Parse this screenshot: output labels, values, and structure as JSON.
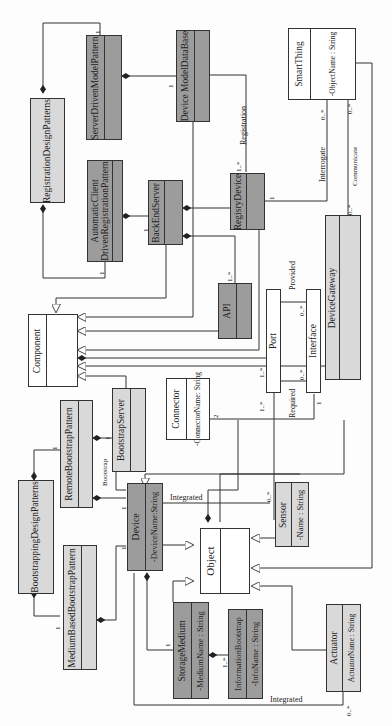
{
  "diagram": {
    "type": "UML class diagram",
    "orientation": "rotated 90 degrees counter-clockwise",
    "classes": {
      "registration_design_patterns": {
        "name": "RegistrationDesignPatterns",
        "attribute": ""
      },
      "server_driven_model_pattern": {
        "name": "ServerDrivenModelPattern",
        "attribute": ""
      },
      "device_model_database": {
        "name": "Device ModelDataBase",
        "attribute": ""
      },
      "smart_thing": {
        "name": "SmartThing",
        "attribute": "-ObjectName : String"
      },
      "automatic_client_driven_registration_pattern": {
        "name_line1": "AutomaticClient",
        "name_line2": "DrivenRegistrationPattern",
        "attribute": ""
      },
      "back_end_server": {
        "name": "BackEndServer",
        "attribute": ""
      },
      "registry_device": {
        "name": "RegisryDevice",
        "attribute": ""
      },
      "device_gateway": {
        "name": "DeviceGateway",
        "attribute": ""
      },
      "api": {
        "name": "API",
        "attribute": ""
      },
      "port": {
        "name": "Port"
      },
      "interface": {
        "name": "Interface"
      },
      "component": {
        "name": "Component",
        "attribute": ""
      },
      "connector": {
        "name": "Connector",
        "attribute": "-ConnectorName: String"
      },
      "remote_bootstrap_pattern": {
        "name": "RemoteBootstrapPattern",
        "attribute": ""
      },
      "bootstrap_server": {
        "name": "BootstrapServer",
        "attribute": ""
      },
      "bootstrapping_design_patterns": {
        "name": "BootstrappingDesignPatterns",
        "attribute": ""
      },
      "device": {
        "name": "Device",
        "attribute": "-DeviceName:String"
      },
      "sensor": {
        "name": "Sensor",
        "attribute": "-Name : String"
      },
      "object": {
        "name": "Object",
        "attribute": ""
      },
      "medium_based_bootstrap_pattern": {
        "name": "MediumBasedBootstrapPattern",
        "attribute": ""
      },
      "storage_medium": {
        "name": "StorageMedium",
        "attribute": "-MediumName : String"
      },
      "information_bootstrap": {
        "name": "InformationBootstrap",
        "attribute": "-InfoName : String"
      },
      "actuator": {
        "name": "Actuator",
        "attribute": "ActuatorName : String"
      }
    },
    "association_labels": {
      "registration": "Registration",
      "interrogate": "Interrogate",
      "communicate": "Communicate",
      "provided": "Provided",
      "required": "Required",
      "bootstrap": "Bootstrap",
      "integrated_sensor": "Integrated",
      "integrated_actuator": "Integrated"
    },
    "multiplicities": {
      "one": "1",
      "one_many": "1..*",
      "zero_many": "0..*",
      "two": "2"
    },
    "colors": {
      "dark_fill": "#9c9c9c",
      "light_fill": "#d9d9d9",
      "white_fill": "#ffffff",
      "line": "#333333"
    }
  }
}
